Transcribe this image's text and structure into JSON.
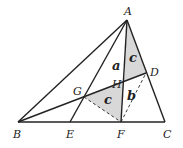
{
  "diagram": {
    "type": "geometry-triangle",
    "points": {
      "A": {
        "label": "A",
        "x": 127,
        "y": 20
      },
      "B": {
        "label": "B",
        "x": 18,
        "y": 122
      },
      "C": {
        "label": "C",
        "x": 165,
        "y": 122
      },
      "D": {
        "label": "D",
        "x": 146,
        "y": 73
      },
      "E": {
        "label": "E",
        "x": 70,
        "y": 122
      },
      "F": {
        "label": "F",
        "x": 121,
        "y": 122
      },
      "G": {
        "label": "G",
        "x": 84,
        "y": 97
      },
      "H": {
        "label": "H",
        "x": 124,
        "y": 81
      }
    },
    "segments": [
      {
        "from": "A",
        "to": "B",
        "style": "solid"
      },
      {
        "from": "A",
        "to": "C",
        "style": "solid"
      },
      {
        "from": "B",
        "to": "C",
        "style": "solid"
      },
      {
        "from": "A",
        "to": "E",
        "style": "solid"
      },
      {
        "from": "A",
        "to": "F",
        "style": "solid"
      },
      {
        "from": "B",
        "to": "D",
        "style": "solid"
      },
      {
        "from": "G",
        "to": "F",
        "style": "dashed"
      },
      {
        "from": "F",
        "to": "D",
        "style": "dashed"
      }
    ],
    "shaded_regions": [
      {
        "vertices": [
          "A",
          "H",
          "D"
        ],
        "label": "c",
        "color": "#d8d8d8"
      },
      {
        "vertices": [
          "G",
          "H",
          "F"
        ],
        "label": "c",
        "color": "#d8d8d8"
      }
    ],
    "region_labels": [
      {
        "text": "a",
        "x": 112,
        "y": 70
      },
      {
        "text": "c",
        "x": 129,
        "y": 62
      },
      {
        "text": "b",
        "x": 127,
        "y": 100
      },
      {
        "text": "c",
        "x": 104,
        "y": 104
      }
    ],
    "vertex_labels": [
      {
        "text": "A",
        "x": 124,
        "y": 15
      },
      {
        "text": "B",
        "x": 13,
        "y": 138
      },
      {
        "text": "C",
        "x": 163,
        "y": 138
      },
      {
        "text": "D",
        "x": 150,
        "y": 76
      },
      {
        "text": "E",
        "x": 66,
        "y": 138
      },
      {
        "text": "F",
        "x": 117,
        "y": 138
      },
      {
        "text": "G",
        "x": 73,
        "y": 95
      },
      {
        "text": "H",
        "x": 112,
        "y": 88
      }
    ],
    "colors": {
      "stroke": "#222222",
      "shade": "#d8d8d8",
      "background": "#ffffff"
    }
  }
}
